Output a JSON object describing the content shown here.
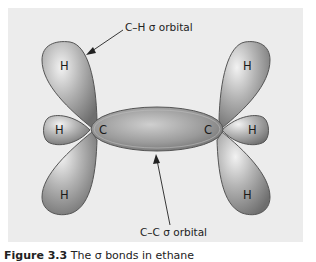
{
  "figure": {
    "labels": {
      "ch_orbital": "C–H σ orbital",
      "cc_orbital": "C–C σ orbital"
    },
    "atoms": {
      "h_top_left": "H",
      "h_mid_left": "H",
      "h_bottom_left": "H",
      "c_left": "C",
      "c_right": "C",
      "h_top_right": "H",
      "h_mid_right": "H",
      "h_bottom_right": "H"
    },
    "caption": {
      "prefix": "Figure 3.3",
      "text": "The σ bonds in ethane"
    },
    "colors": {
      "background": "#ececec",
      "orbital_light": "#e8e8e8",
      "orbital_dark": "#7a7a7a",
      "outline": "#555555"
    }
  }
}
